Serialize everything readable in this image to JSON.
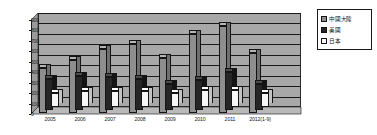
{
  "chart_data": {
    "type": "bar",
    "title": "",
    "subtitle": "",
    "xlabel": "",
    "ylabel": "",
    "ylim": [
      0,
      900
    ],
    "ytick_step": 100,
    "yticks": [
      "0",
      "100",
      "200",
      "300",
      "400",
      "500",
      "600",
      "700",
      "800",
      "900"
    ],
    "grid": true,
    "legend_position": "right",
    "style": "3d-grouped-bar-grayscale",
    "categories": [
      "2005",
      "2006",
      "2007",
      "2008",
      "2009",
      "2010",
      "2011",
      "2012(1-9)"
    ],
    "series": [
      {
        "name": "中國大陸",
        "color": "#8e8e8e",
        "top_color": "#b4b4b4",
        "side_color": "#6f6f6f",
        "values": [
          430,
          510,
          610,
          660,
          530,
          755,
          830,
          575
        ]
      },
      {
        "name": "美國",
        "color": "#262626",
        "top_color": "#4a4a4a",
        "side_color": "#141414",
        "values": [
          300,
          325,
          320,
          295,
          245,
          290,
          365,
          250
        ]
      },
      {
        "name": "日本",
        "color": "#f7f7f7",
        "top_color": "#ffffff",
        "side_color": "#c4c4c4",
        "values": [
          130,
          150,
          150,
          155,
          130,
          165,
          160,
          130
        ]
      }
    ],
    "plot_background": "#a8a8a8",
    "axis_color": "#1a1a1a"
  },
  "legend": {
    "items": [
      {
        "label": "中國大陸"
      },
      {
        "label": "美國"
      },
      {
        "label": "日本"
      }
    ]
  }
}
